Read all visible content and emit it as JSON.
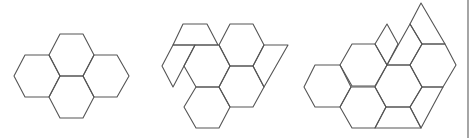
{
  "diagram": {
    "stroke_color": "#555555",
    "background": "#ffffff",
    "figures": [
      {
        "id": "figure-1",
        "description": "four regular hexagons",
        "shapes": [
          {
            "name": "hexagon-top",
            "points": [
              [
                60,
                34
              ],
              [
                83,
                34
              ],
              [
                94,
                55
              ],
              [
                83,
                76
              ],
              [
                60,
                76
              ],
              [
                49,
                55
              ]
            ]
          },
          {
            "name": "hexagon-left",
            "points": [
              [
                25,
                55
              ],
              [
                49,
                55
              ],
              [
                60,
                76
              ],
              [
                49,
                97
              ],
              [
                25,
                97
              ],
              [
                14,
                76
              ]
            ]
          },
          {
            "name": "hexagon-right",
            "points": [
              [
                94,
                55
              ],
              [
                117,
                55
              ],
              [
                129,
                76
              ],
              [
                117,
                97
              ],
              [
                94,
                97
              ],
              [
                83,
                76
              ]
            ]
          },
          {
            "name": "hexagon-bottom",
            "points": [
              [
                60,
                76
              ],
              [
                83,
                76
              ],
              [
                94,
                97
              ],
              [
                83,
                118
              ],
              [
                60,
                118
              ],
              [
                49,
                97
              ]
            ]
          }
        ]
      },
      {
        "id": "figure-2",
        "description": "four hexagons with trapezoid and parallelogram pieces",
        "shapes": [
          {
            "name": "trapezoid-top-left",
            "points": [
              [
                183,
                24
              ],
              [
                207,
                24
              ],
              [
                218,
                45
              ],
              [
                173,
                45
              ]
            ]
          },
          {
            "name": "parallelogram-left",
            "points": [
              [
                173,
                45
              ],
              [
                195,
                45
              ],
              [
                173,
                87
              ],
              [
                162,
                66
              ]
            ]
          },
          {
            "name": "hexagon-center",
            "points": [
              [
                195,
                45
              ],
              [
                219,
                45
              ],
              [
                230,
                66
              ],
              [
                219,
                87
              ],
              [
                196,
                87
              ],
              [
                184,
                66
              ]
            ]
          },
          {
            "name": "hexagon-top-right",
            "points": [
              [
                230,
                24
              ],
              [
                253,
                24
              ],
              [
                264,
                45
              ],
              [
                253,
                66
              ],
              [
                230,
                66
              ],
              [
                219,
                45
              ]
            ]
          },
          {
            "name": "parallelogram-right",
            "points": [
              [
                264,
                45
              ],
              [
                288,
                45
              ],
              [
                264,
                87
              ],
              [
                253,
                66
              ]
            ]
          },
          {
            "name": "hexagon-right-middle",
            "points": [
              [
                230,
                66
              ],
              [
                253,
                66
              ],
              [
                264,
                87
              ],
              [
                253,
                107
              ],
              [
                230,
                107
              ],
              [
                219,
                87
              ]
            ]
          },
          {
            "name": "hexagon-bottom",
            "points": [
              [
                196,
                87
              ],
              [
                219,
                87
              ],
              [
                230,
                107
              ],
              [
                219,
                128
              ],
              [
                196,
                128
              ],
              [
                184,
                107
              ]
            ]
          }
        ]
      },
      {
        "id": "figure-3",
        "description": "hexagons with rhombus, triangle, trapezoid pieces",
        "shapes": [
          {
            "name": "hexagon-left",
            "points": [
              [
                315,
                65
              ],
              [
                340,
                65
              ],
              [
                351,
                87
              ],
              [
                340,
                107
              ],
              [
                315,
                107
              ],
              [
                304,
                87
              ]
            ]
          },
          {
            "name": "hexagon-upper",
            "points": [
              [
                352,
                44
              ],
              [
                375,
                44
              ],
              [
                387,
                65
              ],
              [
                375,
                86
              ],
              [
                352,
                86
              ],
              [
                340,
                65
              ]
            ]
          },
          {
            "name": "hexagon-lower",
            "points": [
              [
                351,
                87
              ],
              [
                375,
                87
              ],
              [
                386,
                107
              ],
              [
                375,
                128
              ],
              [
                352,
                128
              ],
              [
                340,
                107
              ]
            ]
          },
          {
            "name": "hexagon-center-right",
            "points": [
              [
                387,
                65
              ],
              [
                410,
                65
              ],
              [
                422,
                87
              ],
              [
                410,
                107
              ],
              [
                386,
                107
              ],
              [
                375,
                87
              ]
            ]
          },
          {
            "name": "rhombus-top",
            "points": [
              [
                387,
                24
              ],
              [
                398,
                44
              ],
              [
                387,
                65
              ],
              [
                375,
                44
              ]
            ]
          },
          {
            "name": "trapezoid-upper",
            "points": [
              [
                410,
                24
              ],
              [
                422,
                44
              ],
              [
                410,
                65
              ],
              [
                387,
                65
              ]
            ]
          },
          {
            "name": "triangle-top",
            "points": [
              [
                421,
                3
              ],
              [
                445,
                44
              ],
              [
                422,
                44
              ],
              [
                410,
                24
              ]
            ]
          },
          {
            "name": "hexagon-right",
            "points": [
              [
                422,
                44
              ],
              [
                445,
                44
              ],
              [
                456,
                65
              ],
              [
                443,
                87
              ],
              [
                422,
                87
              ],
              [
                410,
                65
              ]
            ]
          },
          {
            "name": "parallelogram-lower-right",
            "points": [
              [
                422,
                87
              ],
              [
                443,
                87
              ],
              [
                421,
                128
              ],
              [
                410,
                107
              ]
            ]
          },
          {
            "name": "trapezoid-bottom",
            "points": [
              [
                386,
                107
              ],
              [
                410,
                107
              ],
              [
                421,
                128
              ],
              [
                375,
                128
              ]
            ]
          }
        ]
      }
    ],
    "edge_line": {
      "x": 468,
      "y1": 0,
      "y2": 138
    }
  }
}
